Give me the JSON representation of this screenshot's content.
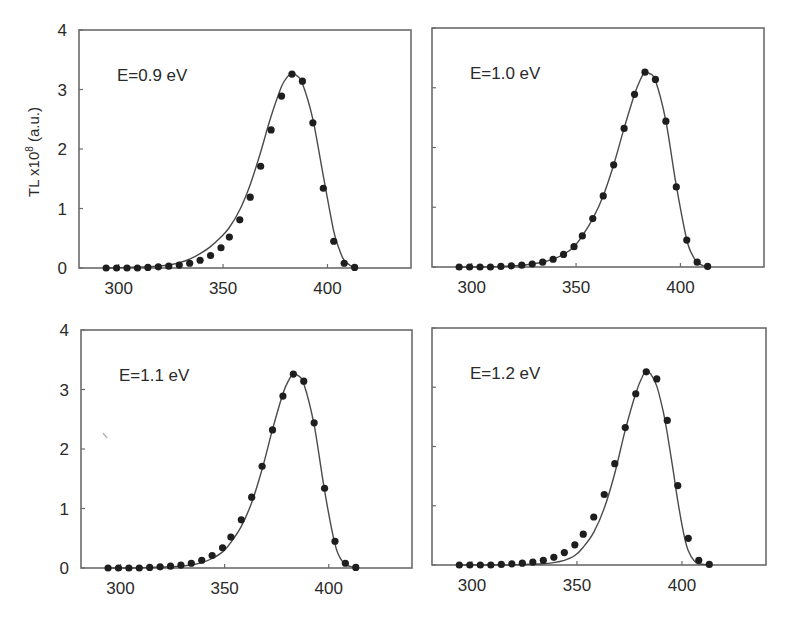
{
  "chart_data": [
    {
      "type": "scatter",
      "panel": "top-left",
      "annotation": "E=0.9 eV",
      "xlabel": "",
      "ylabel": "TL x10^8 (a.u.)",
      "xlim": [
        281,
        440
      ],
      "ylim": [
        0,
        4
      ],
      "xticks": [
        300,
        350,
        400
      ],
      "yticks": [
        0,
        1,
        2,
        3,
        4
      ],
      "show_xticklabels": true,
      "show_yticklabels": true,
      "grid": false,
      "series": [
        {
          "name": "data",
          "kind": "points",
          "x": [
            294,
            299,
            304,
            309,
            314,
            319,
            324,
            329,
            334,
            339,
            344,
            349,
            353,
            358,
            363,
            368,
            373,
            378,
            383,
            388,
            393,
            398,
            403,
            408,
            413
          ],
          "y": [
            0,
            0,
            0,
            0,
            0.01,
            0.02,
            0.03,
            0.05,
            0.08,
            0.13,
            0.21,
            0.34,
            0.52,
            0.81,
            1.19,
            1.71,
            2.32,
            2.89,
            3.26,
            3.14,
            2.44,
            1.34,
            0.45,
            0.08,
            0.01
          ]
        },
        {
          "name": "fit",
          "kind": "line",
          "x": [
            294,
            304,
            314,
            324,
            329,
            334,
            339,
            344,
            349,
            353,
            358,
            363,
            368,
            373,
            378,
            381,
            383,
            385,
            388,
            393,
            398,
            403,
            406,
            408,
            411,
            413
          ],
          "y": [
            0,
            0.01,
            0.02,
            0.05,
            0.09,
            0.15,
            0.24,
            0.36,
            0.52,
            0.68,
            0.98,
            1.4,
            1.95,
            2.55,
            3.05,
            3.22,
            3.27,
            3.24,
            3.1,
            2.5,
            1.55,
            0.62,
            0.28,
            0.13,
            0.04,
            0.02
          ]
        }
      ]
    },
    {
      "type": "scatter",
      "panel": "top-right",
      "annotation": "E=1.0 eV",
      "xlabel": "",
      "ylabel": "",
      "xlim": [
        281,
        440
      ],
      "ylim": [
        0,
        4
      ],
      "xticks": [
        300,
        350,
        400
      ],
      "yticks": [
        0,
        1,
        2,
        3,
        4
      ],
      "show_xticklabels": true,
      "show_yticklabels": false,
      "grid": false,
      "series": [
        {
          "name": "data",
          "kind": "points",
          "x": [
            294,
            299,
            304,
            309,
            314,
            319,
            324,
            329,
            334,
            339,
            344,
            349,
            353,
            358,
            363,
            368,
            373,
            378,
            383,
            388,
            393,
            398,
            403,
            408,
            413
          ],
          "y": [
            0,
            0,
            0,
            0,
            0.01,
            0.02,
            0.03,
            0.05,
            0.08,
            0.13,
            0.21,
            0.34,
            0.52,
            0.81,
            1.19,
            1.71,
            2.32,
            2.89,
            3.26,
            3.14,
            2.44,
            1.34,
            0.45,
            0.08,
            0.01
          ]
        },
        {
          "name": "fit",
          "kind": "line",
          "x": [
            294,
            304,
            314,
            324,
            329,
            334,
            339,
            344,
            349,
            353,
            358,
            363,
            368,
            373,
            378,
            381,
            383,
            385,
            388,
            393,
            398,
            403,
            406,
            408,
            411,
            413
          ],
          "y": [
            0,
            0,
            0.01,
            0.03,
            0.05,
            0.08,
            0.13,
            0.21,
            0.34,
            0.52,
            0.81,
            1.19,
            1.71,
            2.32,
            2.89,
            3.15,
            3.26,
            3.24,
            3.12,
            2.44,
            1.36,
            0.46,
            0.18,
            0.08,
            0.02,
            0.01
          ]
        }
      ]
    },
    {
      "type": "scatter",
      "panel": "bottom-left",
      "annotation": "E=1.1 eV",
      "xlabel": "",
      "ylabel": "",
      "xlim": [
        281,
        440
      ],
      "ylim": [
        0,
        4
      ],
      "xticks": [
        300,
        350,
        400
      ],
      "yticks": [
        0,
        1,
        2,
        3,
        4
      ],
      "show_xticklabels": true,
      "show_yticklabels": true,
      "grid": false,
      "series": [
        {
          "name": "data",
          "kind": "points",
          "x": [
            294,
            299,
            304,
            309,
            314,
            319,
            324,
            329,
            334,
            339,
            344,
            349,
            353,
            358,
            363,
            368,
            373,
            378,
            383,
            388,
            393,
            398,
            403,
            408,
            413
          ],
          "y": [
            0,
            0,
            0,
            0,
            0.01,
            0.02,
            0.03,
            0.05,
            0.08,
            0.13,
            0.21,
            0.34,
            0.52,
            0.81,
            1.19,
            1.71,
            2.32,
            2.89,
            3.26,
            3.14,
            2.44,
            1.34,
            0.45,
            0.08,
            0.01
          ]
        },
        {
          "name": "fit",
          "kind": "line",
          "x": [
            294,
            304,
            314,
            324,
            329,
            334,
            339,
            344,
            349,
            353,
            358,
            363,
            368,
            373,
            378,
            381,
            383,
            385,
            388,
            393,
            398,
            403,
            406,
            408,
            411,
            413
          ],
          "y": [
            0,
            0,
            0.01,
            0.02,
            0.03,
            0.05,
            0.09,
            0.16,
            0.27,
            0.43,
            0.7,
            1.1,
            1.66,
            2.33,
            2.93,
            3.17,
            3.27,
            3.24,
            3.1,
            2.4,
            1.3,
            0.4,
            0.14,
            0.06,
            0.02,
            0.01
          ]
        }
      ]
    },
    {
      "type": "scatter",
      "panel": "bottom-right",
      "annotation": "E=1.2 eV",
      "xlabel": "",
      "ylabel": "",
      "xlim": [
        281,
        440
      ],
      "ylim": [
        0,
        4
      ],
      "xticks": [
        300,
        350,
        400
      ],
      "yticks": [
        0,
        1,
        2,
        3,
        4
      ],
      "show_xticklabels": true,
      "show_yticklabels": false,
      "grid": false,
      "series": [
        {
          "name": "data",
          "kind": "points",
          "x": [
            294,
            299,
            304,
            309,
            314,
            319,
            324,
            329,
            334,
            339,
            344,
            349,
            353,
            358,
            363,
            368,
            373,
            378,
            383,
            388,
            393,
            398,
            403,
            408,
            413
          ],
          "y": [
            0,
            0,
            0,
            0,
            0.01,
            0.02,
            0.03,
            0.05,
            0.08,
            0.13,
            0.21,
            0.34,
            0.52,
            0.81,
            1.19,
            1.71,
            2.32,
            2.89,
            3.26,
            3.14,
            2.44,
            1.34,
            0.45,
            0.08,
            0.01
          ]
        },
        {
          "name": "fit",
          "kind": "line",
          "x": [
            294,
            314,
            324,
            334,
            339,
            344,
            349,
            353,
            358,
            363,
            368,
            373,
            378,
            381,
            383,
            385,
            388,
            391,
            393,
            396,
            398,
            401,
            403,
            406,
            408,
            413
          ],
          "y": [
            0,
            0,
            0.01,
            0.02,
            0.04,
            0.08,
            0.16,
            0.3,
            0.55,
            0.96,
            1.55,
            2.28,
            2.9,
            3.17,
            3.27,
            3.23,
            3.02,
            2.6,
            2.22,
            1.55,
            1.08,
            0.5,
            0.24,
            0.06,
            0.02,
            0
          ]
        }
      ]
    }
  ]
}
